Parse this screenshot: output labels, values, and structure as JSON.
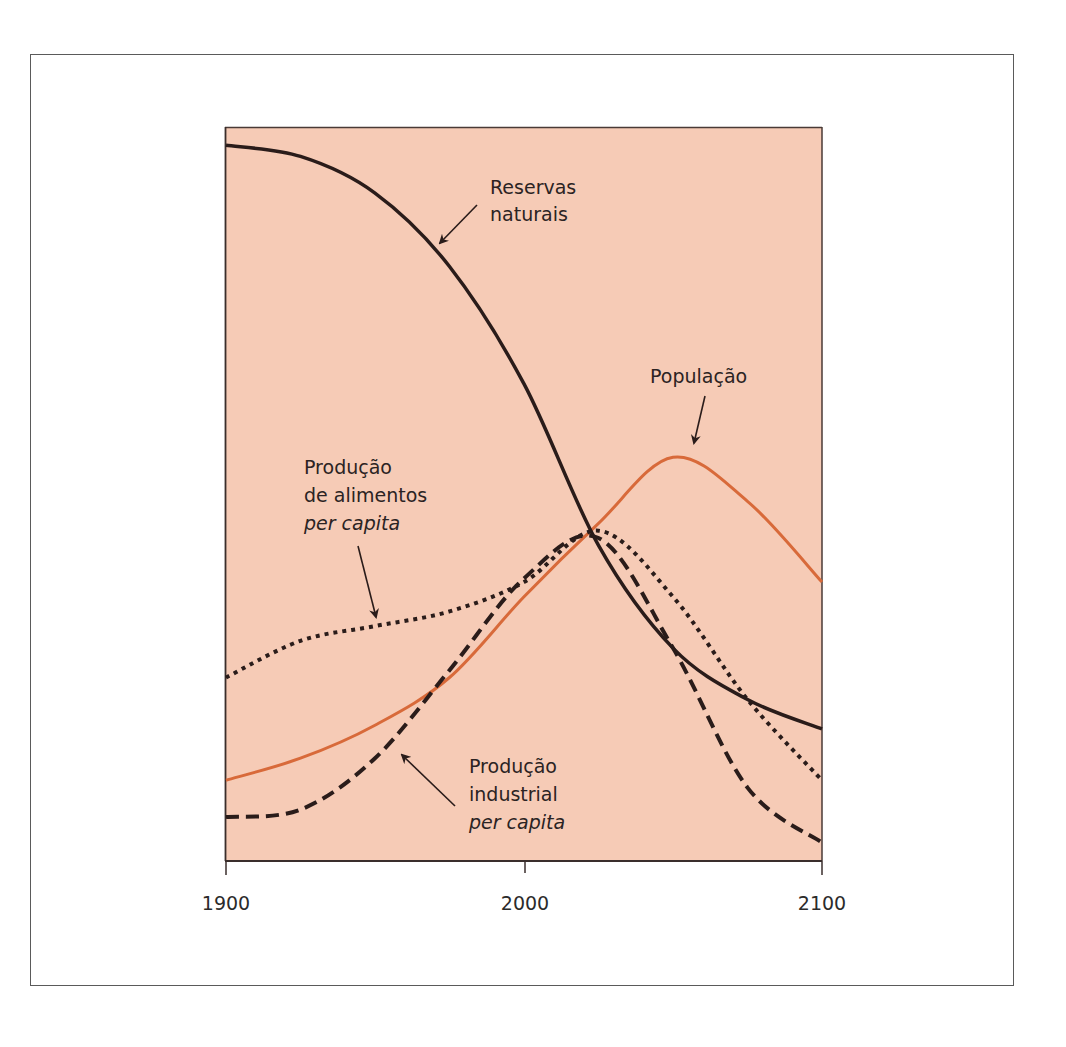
{
  "chart_data": {
    "type": "line",
    "title": "",
    "xlabel": "",
    "ylabel": "",
    "x": [
      1900,
      1925,
      1950,
      1975,
      2000,
      2025,
      2050,
      2075,
      2100
    ],
    "xlim": [
      1900,
      2100
    ],
    "ylim": [
      0,
      100
    ],
    "x_ticks": [
      "1900",
      "2000",
      "2100"
    ],
    "grid": false,
    "legend": "inline annotations with arrows",
    "background_color": "#f6cbb6",
    "series": [
      {
        "name": "Reservas naturais",
        "style": "solid",
        "color": "#2a1c1a",
        "values": [
          97.5,
          96,
          91,
          81,
          65,
          43,
          29,
          22,
          18
        ]
      },
      {
        "name": "População",
        "style": "solid",
        "color": "#d86a3a",
        "values": [
          11,
          14,
          18.5,
          25,
          36,
          46,
          55,
          49,
          38
        ]
      },
      {
        "name": "Produção de alimentos per capita",
        "style": "dotted",
        "color": "#2a1c1a",
        "values": [
          25,
          30,
          32,
          34,
          38,
          45,
          36,
          22,
          11
        ]
      },
      {
        "name": "Produção industrial per capita",
        "style": "dashed",
        "color": "#2a1c1a",
        "values": [
          6,
          7,
          14,
          26,
          38.5,
          44,
          29,
          10,
          2.5
        ]
      }
    ]
  },
  "annotations": {
    "reservas": {
      "line1": "Reservas",
      "line2": "naturais"
    },
    "populacao": {
      "line1": "População"
    },
    "alimentos": {
      "line1": "Produção",
      "line2": "de alimentos",
      "line3": "per capita"
    },
    "industrial": {
      "line1": "Produção",
      "line2": "industrial",
      "line3": "per capita"
    }
  },
  "axis": {
    "tick_1900": "1900",
    "tick_2000": "2000",
    "tick_2100": "2100"
  }
}
